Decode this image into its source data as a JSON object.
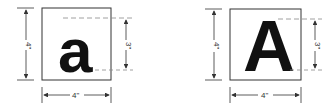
{
  "figures": [
    {
      "id": "lowercase",
      "letter": "a",
      "box_width_label": "4\"",
      "box_height_label": "4\"",
      "letter_height_label": "3\""
    },
    {
      "id": "uppercase",
      "letter": "A",
      "box_width_label": "4\"",
      "box_height_label": "4\"",
      "letter_height_label": "3\""
    }
  ],
  "colors": {
    "line": "#333333",
    "glyph": "#111111",
    "dash": "#888888"
  }
}
